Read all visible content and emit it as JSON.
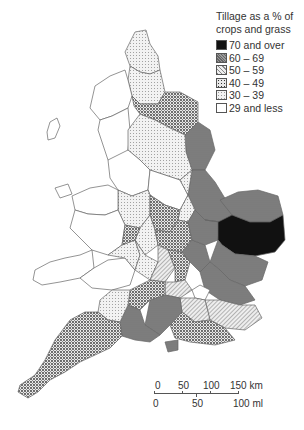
{
  "legend": {
    "title_line1": "Tillage as a % of",
    "title_line2": "crops and grass",
    "items": [
      {
        "label": "70 and over",
        "pattern": "solid-black",
        "fill": "#111111"
      },
      {
        "label": "60 – 69",
        "pattern": "dense-dark-dots",
        "fill": "#777777"
      },
      {
        "label": "50 – 59",
        "pattern": "diagonal-hatch",
        "fill": "#bbbbbb"
      },
      {
        "label": "40 – 49",
        "pattern": "checker-dots",
        "fill": "#999999"
      },
      {
        "label": "30 – 39",
        "pattern": "light-dots",
        "fill": "#dddddd"
      },
      {
        "label": "29 and less",
        "pattern": "blank",
        "fill": "#ffffff"
      }
    ]
  },
  "scale_bar": {
    "km_ticks": [
      "0",
      "50",
      "100",
      "150 km"
    ],
    "mi_ticks": [
      "0",
      "50",
      "100 ml"
    ]
  }
}
